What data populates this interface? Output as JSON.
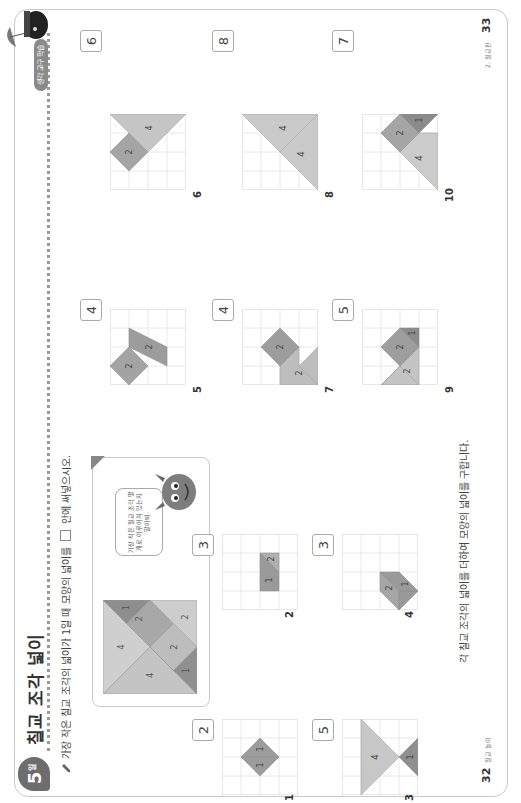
{
  "header": {
    "day_badge": "5",
    "day_badge_suffix": "일",
    "title": "칠교 조각 넓이",
    "category_pill": "생각 교구 학습"
  },
  "instruction": {
    "text_before": "가장 작은 칠교 조각의 넓이가 1일 때 모양의 넓이를",
    "text_after": "안에 써넣으시오."
  },
  "example": {
    "speech_bubble": "가장 작은 칠교 조각 몇 개로 이루어져 있는지 알아봐.",
    "piece_labels": [
      "4",
      "4",
      "2",
      "2",
      "2",
      "1",
      "1"
    ]
  },
  "problems": [
    {
      "number": "1",
      "answer": "2",
      "piece_labels": [
        "1",
        "1"
      ]
    },
    {
      "number": "2",
      "answer": "3",
      "piece_labels": [
        "1",
        "2"
      ]
    },
    {
      "number": "3",
      "answer": "5",
      "piece_labels": [
        "4",
        "1"
      ]
    },
    {
      "number": "4",
      "answer": "3",
      "piece_labels": [
        "2",
        "1"
      ]
    },
    {
      "number": "5",
      "answer": "4",
      "piece_labels": [
        "2",
        "2"
      ]
    },
    {
      "number": "6",
      "answer": "6",
      "piece_labels": [
        "2",
        "4"
      ]
    },
    {
      "number": "7",
      "answer": "4",
      "piece_labels": [
        "2",
        "2"
      ]
    },
    {
      "number": "8",
      "answer": "8",
      "piece_labels": [
        "4",
        "4"
      ]
    },
    {
      "number": "9",
      "answer": "5",
      "piece_labels": [
        "2",
        "2",
        "1"
      ]
    },
    {
      "number": "10",
      "answer": "7",
      "piece_labels": [
        "4",
        "2",
        "1"
      ]
    }
  ],
  "hint": "각 칠교 조각의 넓이를 더하여 모양의 넓이를 구합니다.",
  "footer": {
    "left_page_number": "32",
    "left_footer_label": "칠교 놀이",
    "right_page_number": "33",
    "right_footer_label": "2. 칠교판"
  },
  "colors": {
    "light_piece": "#c8c8c8",
    "mid_piece": "#a9a9a9",
    "dark_piece": "#8c8c8c",
    "grid_line": "#e2e2e2",
    "badge": "#6d6d6d"
  }
}
